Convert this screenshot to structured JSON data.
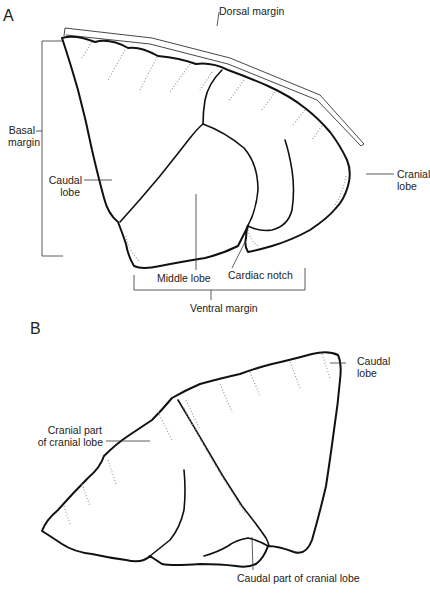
{
  "figure": {
    "panels": [
      {
        "letter": "A",
        "labels": {
          "dorsal_margin": "Dorsal margin",
          "basal_margin_line1": "Basal",
          "basal_margin_line2": "margin",
          "caudal_lobe_line1": "Caudal",
          "caudal_lobe_line2": "lobe",
          "cranial_lobe_line1": "Cranial",
          "cranial_lobe_line2": "lobe",
          "middle_lobe": "Middle lobe",
          "cardiac_notch": "Cardiac notch",
          "ventral_margin": "Ventral margin"
        }
      },
      {
        "letter": "B",
        "labels": {
          "caudal_lobe_line1": "Caudal",
          "caudal_lobe_line2": "lobe",
          "cranial_part_line1": "Cranial part",
          "cranial_part_line2": "of cranial lobe",
          "caudal_part": "Caudal part of cranial lobe"
        }
      }
    ]
  }
}
